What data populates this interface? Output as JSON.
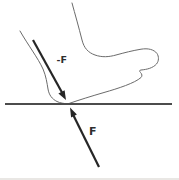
{
  "figure": {
    "type": "force-diagram",
    "labels": {
      "action_force": "-F",
      "reaction_force": "F"
    },
    "colors": {
      "outline": "#6b6b6b",
      "arrow": "#262626",
      "ground": "#4c4c4c",
      "label": "#2e2e2e",
      "page_edge": "#e9e7e4",
      "background": "#ffffff"
    }
  }
}
